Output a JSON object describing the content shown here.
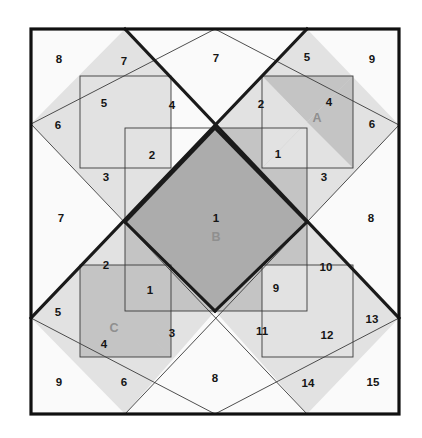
{
  "figure": {
    "canvas": {
      "width": 422,
      "height": 438
    },
    "background_color": "#FFFFFF"
  },
  "palette": {
    "background_white": "#FFFFFF",
    "fill_near_white": "#FAFAFA",
    "fill_light_gray": "#E2E2E2",
    "fill_medium_gray": "#C4C4C4",
    "fill_dark_gray": "#ACACAC",
    "thin_line": "#3A3A3A",
    "thick_line": "#1A1A1A",
    "frame_line": "#111111",
    "number_text": "#151515",
    "letter_text": "#8F8F8F"
  },
  "frame": {
    "x": 31,
    "y": 29,
    "width": 368,
    "height": 385
  },
  "numbered_regions": [
    {
      "id": "n-8-topleft",
      "label": "8",
      "x": 59,
      "y": 60,
      "fill": "#FAFAFA"
    },
    {
      "id": "n-7-topleft",
      "label": "7",
      "x": 124,
      "y": 62,
      "fill": "#E2E2E2"
    },
    {
      "id": "n-7-topcenter",
      "label": "7",
      "x": 216,
      "y": 59,
      "fill": "#FAFAFA"
    },
    {
      "id": "n-5-topright",
      "label": "5",
      "x": 307,
      "y": 58,
      "fill": "#E2E2E2"
    },
    {
      "id": "n-9-topright",
      "label": "9",
      "x": 372,
      "y": 60,
      "fill": "#FAFAFA"
    },
    {
      "id": "n-6-left",
      "label": "6",
      "x": 58,
      "y": 126,
      "fill": "#E2E2E2"
    },
    {
      "id": "n-5-upperleft",
      "label": "5",
      "x": 104,
      "y": 104,
      "fill": "#E2E2E2"
    },
    {
      "id": "n-4-upperleft",
      "label": "4",
      "x": 172,
      "y": 106,
      "fill": "#FAFAFA"
    },
    {
      "id": "n-2-upperright",
      "label": "2",
      "x": 261,
      "y": 105,
      "fill": "#E2E2E2"
    },
    {
      "id": "n-4-upperright",
      "label": "4",
      "x": 329,
      "y": 103,
      "fill": "#C4C4C4"
    },
    {
      "id": "n-6-right",
      "label": "6",
      "x": 372,
      "y": 125,
      "fill": "#E2E2E2"
    },
    {
      "id": "n-2-innerleft",
      "label": "2",
      "x": 152,
      "y": 156,
      "fill": "#E2E2E2"
    },
    {
      "id": "n-1-innerright",
      "label": "1",
      "x": 278,
      "y": 155,
      "fill": "#C4C4C4"
    },
    {
      "id": "n-3-left",
      "label": "3",
      "x": 106,
      "y": 178,
      "fill": "#E2E2E2"
    },
    {
      "id": "n-3-right",
      "label": "3",
      "x": 324,
      "y": 178,
      "fill": "#E2E2E2"
    },
    {
      "id": "n-7-leftmid",
      "label": "7",
      "x": 61,
      "y": 219,
      "fill": "#FAFAFA"
    },
    {
      "id": "n-1-center",
      "label": "1",
      "x": 216,
      "y": 219,
      "fill": "#ACACAC"
    },
    {
      "id": "n-8-rightmid",
      "label": "8",
      "x": 371,
      "y": 219,
      "fill": "#FAFAFA"
    },
    {
      "id": "n-2-lowerleft",
      "label": "2",
      "x": 106,
      "y": 266,
      "fill": "#E2E2E2"
    },
    {
      "id": "n-10-lowerright",
      "label": "10",
      "x": 326,
      "y": 268,
      "fill": "#E2E2E2"
    },
    {
      "id": "n-1-lowerleft",
      "label": "1",
      "x": 150,
      "y": 291,
      "fill": "#C4C4C4"
    },
    {
      "id": "n-9-lowerright",
      "label": "9",
      "x": 276,
      "y": 289,
      "fill": "#C4C4C4"
    },
    {
      "id": "n-5-lowerleft",
      "label": "5",
      "x": 58,
      "y": 313,
      "fill": "#FAFAFA"
    },
    {
      "id": "n-4-lowerleft",
      "label": "4",
      "x": 104,
      "y": 345,
      "fill": "#C4C4C4"
    },
    {
      "id": "n-3-lower",
      "label": "3",
      "x": 172,
      "y": 334,
      "fill": "#E2E2E2"
    },
    {
      "id": "n-11-lower",
      "label": "11",
      "x": 262,
      "y": 332,
      "fill": "#E2E2E2"
    },
    {
      "id": "n-12-lower",
      "label": "12",
      "x": 327,
      "y": 336,
      "fill": "#E2E2E2"
    },
    {
      "id": "n-13-lowerright",
      "label": "13",
      "x": 372,
      "y": 320,
      "fill": "#FAFAFA"
    },
    {
      "id": "n-9-bottomleft",
      "label": "9",
      "x": 59,
      "y": 383,
      "fill": "#FAFAFA"
    },
    {
      "id": "n-6-bottom",
      "label": "6",
      "x": 124,
      "y": 383,
      "fill": "#E2E2E2"
    },
    {
      "id": "n-8-bottomcenter",
      "label": "8",
      "x": 215,
      "y": 379,
      "fill": "#FAFAFA"
    },
    {
      "id": "n-14-bottom",
      "label": "14",
      "x": 308,
      "y": 384,
      "fill": "#E2E2E2"
    },
    {
      "id": "n-15-bottomright",
      "label": "15",
      "x": 373,
      "y": 383,
      "fill": "#FAFAFA"
    }
  ],
  "lettered_regions": [
    {
      "id": "letter-A",
      "label": "A",
      "x": 317,
      "y": 119,
      "fill": "#C4C4C4"
    },
    {
      "id": "letter-B",
      "label": "B",
      "x": 216,
      "y": 238,
      "fill": "#ACACAC"
    },
    {
      "id": "letter-C",
      "label": "C",
      "x": 114,
      "y": 329,
      "fill": "#C4C4C4"
    }
  ]
}
